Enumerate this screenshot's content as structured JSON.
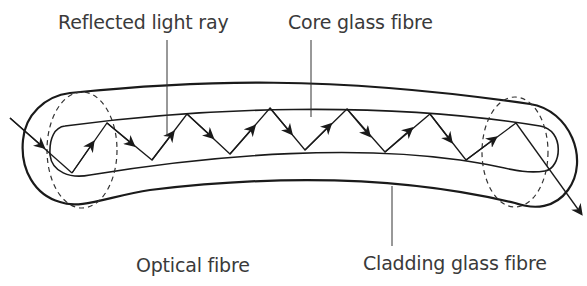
{
  "title": "Optical fibre",
  "labels": {
    "reflected_light_ray": "Reflected light ray",
    "core_glass_fibre": "Core glass fibre",
    "optical_fibre": "Optical fibre",
    "cladding_glass_fibre": "Cladding glass fibre"
  },
  "colors": {
    "stroke": "#1a1a1a",
    "text": "#3a3a3a",
    "background": "#ffffff"
  },
  "ray": {
    "entry": [
      [
        10,
        118
      ],
      [
        72,
        173
      ]
    ],
    "vertices": [
      [
        72,
        173
      ],
      [
        107,
        123
      ],
      [
        152,
        160
      ],
      [
        187,
        114
      ],
      [
        230,
        154
      ],
      [
        270,
        108
      ],
      [
        305,
        150
      ],
      [
        347,
        109
      ],
      [
        385,
        152
      ],
      [
        430,
        114
      ],
      [
        466,
        160
      ],
      [
        516,
        123
      ]
    ],
    "exit": [
      [
        516,
        123
      ],
      [
        580,
        212
      ]
    ]
  }
}
